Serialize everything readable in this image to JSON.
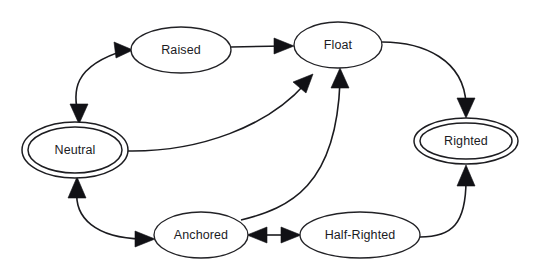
{
  "diagram": {
    "type": "state-transition-diagram",
    "title": "",
    "canvas": {
      "width": 538,
      "height": 272,
      "background": "#ffffff"
    },
    "style": {
      "stroke_color": "#1b1b1f",
      "fill_color": "#ffffff",
      "text_color": "#1b1b1f",
      "arrow_fill": "#111115"
    },
    "nodes": [
      {
        "id": "neutral",
        "label": "Neutral",
        "shape": "double-ellipse",
        "cx": 75,
        "cy": 150,
        "rx": 53,
        "ry": 28,
        "inner_rx": 47,
        "inner_ry": 23
      },
      {
        "id": "raised",
        "label": "Raised",
        "shape": "ellipse",
        "cx": 181,
        "cy": 50,
        "rx": 50,
        "ry": 23
      },
      {
        "id": "float",
        "label": "Float",
        "shape": "ellipse",
        "cx": 338,
        "cy": 45,
        "rx": 44,
        "ry": 23
      },
      {
        "id": "righted",
        "label": "Righted",
        "shape": "double-ellipse",
        "cx": 466,
        "cy": 141,
        "rx": 52,
        "ry": 23,
        "inner_rx": 46,
        "inner_ry": 18
      },
      {
        "id": "anchored",
        "label": "Anchored",
        "shape": "ellipse",
        "cx": 201,
        "cy": 235,
        "rx": 47,
        "ry": 23
      },
      {
        "id": "half_righted",
        "label": "Half-Righted",
        "shape": "ellipse",
        "cx": 360,
        "cy": 235,
        "rx": 60,
        "ry": 23
      }
    ],
    "edges": [
      {
        "id": "neutral-raised",
        "from": "neutral",
        "to": "raised",
        "direction": "bidirectional",
        "style": "curved"
      },
      {
        "id": "raised-float",
        "from": "raised",
        "to": "float",
        "direction": "forward",
        "style": "straight"
      },
      {
        "id": "float-righted",
        "from": "float",
        "to": "righted",
        "direction": "forward",
        "style": "curved"
      },
      {
        "id": "neutral-float",
        "from": "neutral",
        "to": "float",
        "direction": "forward",
        "style": "curved"
      },
      {
        "id": "anchored-float",
        "from": "anchored",
        "to": "float",
        "direction": "forward",
        "style": "curved"
      },
      {
        "id": "neutral-anchored",
        "from": "neutral",
        "to": "anchored",
        "direction": "bidirectional",
        "style": "curved"
      },
      {
        "id": "anchored-half-righted",
        "from": "anchored",
        "to": "half_righted",
        "direction": "bidirectional",
        "style": "straight"
      },
      {
        "id": "half-righted-righted",
        "from": "half_righted",
        "to": "righted",
        "direction": "forward",
        "style": "curved"
      }
    ]
  }
}
